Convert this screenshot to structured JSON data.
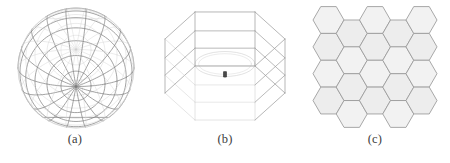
{
  "figure": {
    "background_color": "#ffffff",
    "line_color": "#9a9a9a",
    "line_color_dark": "#7d7d7d",
    "line_color_faint": "#cfcfcf",
    "hex_fill_color": "#f2f2f2",
    "hex_fill_color_alt": "#ededed",
    "caption_color": "#3c3c3c",
    "panels": [
      {
        "id": "panel-a",
        "caption": "(a)",
        "art_name": "wireframe-sphere",
        "description": "wireframe sphere with meridians and parallels",
        "geometry": {
          "type": "sphere-wireframe",
          "center_x": 76,
          "center_y": 68,
          "radius_x": 58,
          "radius_y": 60,
          "meridian_count": 18,
          "parallel_count": 11,
          "pole_tilt_degrees": 18
        }
      },
      {
        "id": "panel-b",
        "caption": "(b)",
        "art_name": "hexagonal-prism-wireframe",
        "description": "hexagonal prism wireframe in 3D perspective with inscribed ellipse and center marker",
        "geometry": {
          "type": "hexagonal-prism-wireframe",
          "center_x": 75,
          "center_y": 66,
          "top_face_radius": 60,
          "prism_height": 54,
          "face_count": 6,
          "has_inscribed_ellipse": true,
          "has_center_marker": true
        }
      },
      {
        "id": "panel-c",
        "caption": "(c)",
        "art_name": "hexagonal-tiling",
        "description": "honeycomb hexagonal tiling, flat-top hexagons in staggered columns",
        "geometry": {
          "type": "hexagon-tiling",
          "orientation": "flat-top",
          "columns": 5,
          "rows_tall_column": 4,
          "rows_short_column": 4,
          "hex_radius": 15.5,
          "stagger": "alternating-columns"
        }
      }
    ]
  }
}
